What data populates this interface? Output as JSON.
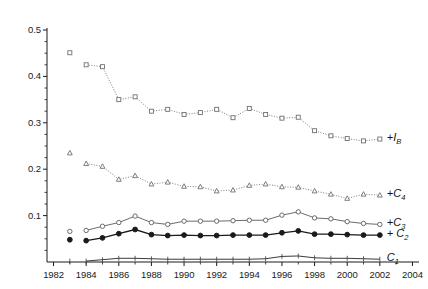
{
  "chart_data": {
    "type": "line",
    "title": "",
    "xlabel": "",
    "ylabel": "",
    "xlim": [
      1981.6,
      2004.4
    ],
    "ylim": [
      0,
      0.5
    ],
    "grid": false,
    "legend_position": "right-inline",
    "y_ticks": [
      0.1,
      0.2,
      0.3,
      0.4,
      0.5
    ],
    "y_tick_labels": [
      "0.1",
      "0.2",
      "0.3",
      "0.4",
      "0.5"
    ],
    "y_minor_step": 0.025,
    "x_ticks": [
      1982,
      1984,
      1986,
      1988,
      1990,
      1992,
      1994,
      1996,
      1998,
      2000,
      2002,
      2004
    ],
    "x_tick_labels": [
      "1982",
      "1984",
      "1986",
      "1988",
      "1990",
      "1992",
      "1994",
      "1996",
      "1998",
      "2000",
      "2002",
      "2004"
    ],
    "x_minor_step": 1,
    "x": [
      1984,
      1985,
      1986,
      1987,
      1988,
      1989,
      1990,
      1991,
      1992,
      1993,
      1994,
      1995,
      1996,
      1997,
      1998,
      1999,
      2000,
      2001,
      2002
    ],
    "series": [
      {
        "name": "I_B",
        "label": "+I",
        "sub": "B",
        "marker": "square-open",
        "line": "dotted",
        "color": "#707070",
        "isolated_1983": 0.451,
        "values": [
          0.425,
          0.421,
          0.35,
          0.356,
          0.325,
          0.329,
          0.318,
          0.322,
          0.329,
          0.311,
          0.331,
          0.318,
          0.31,
          0.312,
          0.283,
          0.272,
          0.266,
          0.261,
          0.265
        ]
      },
      {
        "name": "C_4",
        "label": "+C",
        "sub": "4",
        "marker": "triangle",
        "line": "dotted",
        "color": "#707070",
        "isolated_1983": 0.235,
        "values": [
          0.212,
          0.206,
          0.178,
          0.186,
          0.168,
          0.172,
          0.163,
          0.162,
          0.153,
          0.155,
          0.165,
          0.168,
          0.162,
          0.161,
          0.153,
          0.146,
          0.137,
          0.146,
          0.144
        ]
      },
      {
        "name": "C_3",
        "label": "+C",
        "sub": "3",
        "marker": "circle-open",
        "line": "solid",
        "color": "#6b6b6b",
        "isolated_1983": 0.066,
        "values": [
          0.068,
          0.077,
          0.085,
          0.099,
          0.085,
          0.081,
          0.088,
          0.088,
          0.088,
          0.089,
          0.09,
          0.09,
          0.101,
          0.108,
          0.095,
          0.093,
          0.087,
          0.083,
          0.081
        ]
      },
      {
        "name": "C_2",
        "label": "+ C",
        "sub": "2",
        "marker": "circle-filled",
        "line": "solid",
        "color": "#1a1a1a",
        "isolated_1983": 0.048,
        "values": [
          0.046,
          0.052,
          0.061,
          0.07,
          0.059,
          0.057,
          0.058,
          0.057,
          0.057,
          0.058,
          0.058,
          0.058,
          0.063,
          0.067,
          0.06,
          0.06,
          0.059,
          0.058,
          0.058
        ]
      },
      {
        "name": "C_1",
        "label": "C",
        "sub": "1",
        "marker": "tick",
        "line": "solid",
        "color": "#3a3a3a",
        "isolated_1983": 0.002,
        "values": [
          0.002,
          0.005,
          0.008,
          0.008,
          0.007,
          0.006,
          0.006,
          0.006,
          0.006,
          0.006,
          0.006,
          0.007,
          0.012,
          0.013,
          0.009,
          0.008,
          0.008,
          0.007,
          0.006
        ]
      }
    ]
  }
}
